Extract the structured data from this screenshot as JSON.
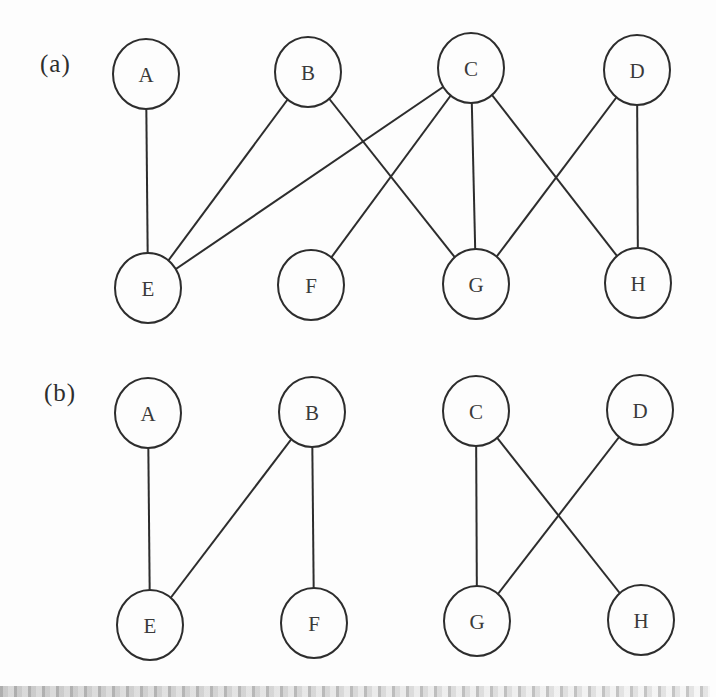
{
  "figure": {
    "style": {
      "background": "#fdfdfd",
      "line_color": "#2d2d2d",
      "node_fill": "#fdfdfd",
      "node_text_color": "#3a3a3a",
      "node_rx": 33,
      "node_ry": 35,
      "line_width": 2
    },
    "panels": [
      {
        "id": "a",
        "label": "(a)",
        "label_pos": {
          "x": 40,
          "y": 50
        },
        "nodes": [
          {
            "id": "A",
            "label": "A",
            "x": 146,
            "y": 74
          },
          {
            "id": "B",
            "label": "B",
            "x": 308,
            "y": 72
          },
          {
            "id": "C",
            "label": "C",
            "x": 471,
            "y": 68
          },
          {
            "id": "D",
            "label": "D",
            "x": 637,
            "y": 70
          },
          {
            "id": "E",
            "label": "E",
            "x": 148,
            "y": 288
          },
          {
            "id": "F",
            "label": "F",
            "x": 311,
            "y": 285
          },
          {
            "id": "G",
            "label": "G",
            "x": 476,
            "y": 284
          },
          {
            "id": "H",
            "label": "H",
            "x": 638,
            "y": 283
          }
        ],
        "edges": [
          [
            "A",
            "E"
          ],
          [
            "B",
            "E"
          ],
          [
            "B",
            "G"
          ],
          [
            "C",
            "E"
          ],
          [
            "C",
            "F"
          ],
          [
            "C",
            "G"
          ],
          [
            "C",
            "H"
          ],
          [
            "D",
            "G"
          ],
          [
            "D",
            "H"
          ]
        ]
      },
      {
        "id": "b",
        "label": "(b)",
        "label_pos": {
          "x": 44,
          "y": 379
        },
        "nodes": [
          {
            "id": "A",
            "label": "A",
            "x": 148,
            "y": 413
          },
          {
            "id": "B",
            "label": "B",
            "x": 312,
            "y": 412
          },
          {
            "id": "C",
            "label": "C",
            "x": 476,
            "y": 411
          },
          {
            "id": "D",
            "label": "D",
            "x": 640,
            "y": 410
          },
          {
            "id": "E",
            "label": "E",
            "x": 150,
            "y": 625
          },
          {
            "id": "F",
            "label": "F",
            "x": 314,
            "y": 623
          },
          {
            "id": "G",
            "label": "G",
            "x": 477,
            "y": 621
          },
          {
            "id": "H",
            "label": "H",
            "x": 641,
            "y": 620
          }
        ],
        "edges": [
          [
            "A",
            "E"
          ],
          [
            "B",
            "E"
          ],
          [
            "B",
            "F"
          ],
          [
            "C",
            "G"
          ],
          [
            "C",
            "H"
          ],
          [
            "D",
            "G"
          ]
        ]
      }
    ]
  }
}
